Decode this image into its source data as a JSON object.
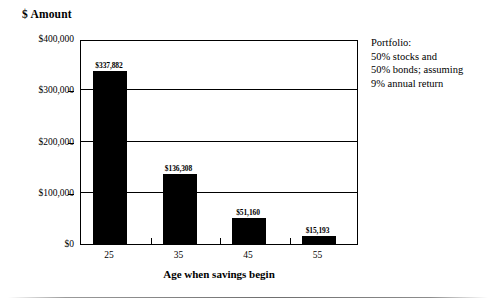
{
  "chart_data": {
    "type": "bar",
    "title": "",
    "categories": [
      "25",
      "35",
      "45",
      "55"
    ],
    "values": [
      337882,
      136308,
      51160,
      15193
    ],
    "value_labels": [
      "$337,882",
      "$136,308",
      "$51,160",
      "$15,193"
    ],
    "xlabel": "Age when savings begin",
    "ylabel": "$ Amount",
    "ylim": [
      0,
      400000
    ],
    "ytick_values": [
      0,
      100000,
      200000,
      300000,
      400000
    ],
    "ytick_labels": [
      "$0",
      "$100,000",
      "$200,000",
      "$300,000",
      "$400,000"
    ],
    "grid": "horizontal",
    "gridline_values": [
      100000,
      200000,
      300000
    ],
    "legend": "none",
    "bar_color": "#000000",
    "annotations": [
      "Portfolio:",
      "50% stocks and",
      "50% bonds; assuming",
      "9% annual return"
    ]
  },
  "annotation": {
    "line1": "Portfolio:",
    "line2": "50% stocks and",
    "line3": "50% bonds; assuming",
    "line4": "9% annual return"
  },
  "axes": {
    "y_title": "$ Amount",
    "x_title": "Age when savings begin",
    "y_labels": [
      "$0",
      "$100,000",
      "$200,000",
      "$300,000",
      "$400,000"
    ],
    "x_labels": [
      "25",
      "35",
      "45",
      "55"
    ]
  },
  "bars": [
    {
      "category": "25",
      "label": "$337,882",
      "value": 337882
    },
    {
      "category": "35",
      "label": "$136,308",
      "value": 136308
    },
    {
      "category": "45",
      "label": "$51,160",
      "value": 51160
    },
    {
      "category": "55",
      "label": "$15,193",
      "value": 15193
    }
  ]
}
